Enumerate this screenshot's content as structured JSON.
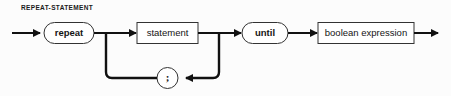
{
  "diagram": {
    "title": "REPEAT-STATEMENT",
    "type": "railroad-syntax-diagram",
    "colors": {
      "background": "#fcfcfc",
      "line": "#111111",
      "node_border": "#333333",
      "node_fill": "#ffffff",
      "text": "#141414"
    },
    "nodes": {
      "repeat_keyword": {
        "label": "repeat",
        "shape": "oval",
        "kind": "terminal"
      },
      "statement": {
        "label": "statement",
        "shape": "rectangle",
        "kind": "nonterminal"
      },
      "separator": {
        "label": ";",
        "shape": "circle",
        "kind": "terminal"
      },
      "until_keyword": {
        "label": "until",
        "shape": "oval",
        "kind": "terminal"
      },
      "boolean_expression": {
        "label": "boolean expression",
        "shape": "rectangle",
        "kind": "nonterminal"
      }
    },
    "icons": {
      "entry_arrow": "arrow-right-icon",
      "exit_arrow": "arrow-right-icon",
      "loop_arrow": "arrow-left-icon"
    },
    "sequence": [
      "repeat",
      "statement",
      "until",
      "boolean expression"
    ],
    "loop": {
      "repeats": "statement",
      "separated_by": ";",
      "direction": "right-to-left"
    }
  }
}
